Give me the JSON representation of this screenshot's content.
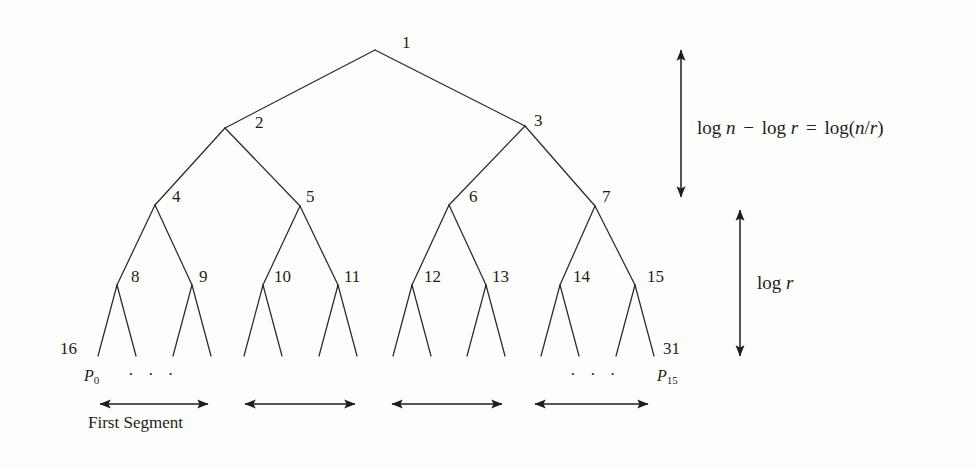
{
  "figure": {
    "type": "binary-tree-diagram",
    "background_color": "#fdfdfc",
    "ink_color": "#1d1d1d",
    "tree": {
      "levels": 5,
      "internal_nodes": [
        {
          "id": "1",
          "label": "1",
          "x": 375,
          "y": 50,
          "label_x": 402,
          "label_y": 34
        },
        {
          "id": "2",
          "label": "2",
          "x": 225,
          "y": 128,
          "label_x": 255,
          "label_y": 114
        },
        {
          "id": "3",
          "label": "3",
          "x": 525,
          "y": 126,
          "label_x": 534,
          "label_y": 112
        },
        {
          "id": "4",
          "label": "4",
          "x": 155,
          "y": 205,
          "label_x": 172,
          "label_y": 188
        },
        {
          "id": "5",
          "label": "5",
          "x": 300,
          "y": 206,
          "label_x": 306,
          "label_y": 188
        },
        {
          "id": "6",
          "label": "6",
          "x": 449,
          "y": 205,
          "label_x": 469,
          "label_y": 188
        },
        {
          "id": "7",
          "label": "7",
          "x": 595,
          "y": 206,
          "label_x": 602,
          "label_y": 188
        },
        {
          "id": "8",
          "label": "8",
          "x": 117,
          "y": 285,
          "label_x": 131,
          "label_y": 268
        },
        {
          "id": "9",
          "label": "9",
          "x": 192,
          "y": 285,
          "label_x": 199,
          "label_y": 268
        },
        {
          "id": "10",
          "label": "10",
          "x": 263,
          "y": 285,
          "label_x": 274,
          "label_y": 268
        },
        {
          "id": "11",
          "label": "11",
          "x": 338,
          "y": 285,
          "label_x": 344,
          "label_y": 268
        },
        {
          "id": "12",
          "label": "12",
          "x": 412,
          "y": 285,
          "label_x": 424,
          "label_y": 268
        },
        {
          "id": "13",
          "label": "13",
          "x": 486,
          "y": 285,
          "label_x": 492,
          "label_y": 268
        },
        {
          "id": "14",
          "label": "14",
          "x": 560,
          "y": 285,
          "label_x": 573,
          "label_y": 268
        },
        {
          "id": "15",
          "label": "15",
          "x": 635,
          "y": 285,
          "label_x": 647,
          "label_y": 268
        }
      ],
      "leaf_labels": [
        {
          "label": "16",
          "x": 60,
          "y": 340
        },
        {
          "label": "31",
          "x": 663,
          "y": 340
        }
      ]
    },
    "processors": [
      {
        "label": "P",
        "sub": "0",
        "x": 84,
        "y": 368
      },
      {
        "label": "P",
        "sub": "15",
        "x": 657,
        "y": 368
      }
    ],
    "ellipses": [
      {
        "text": "·  ·  ·",
        "x": 128,
        "y": 370
      },
      {
        "text": "·  ·  ·",
        "x": 570,
        "y": 370
      }
    ],
    "segment_arrows": [
      {
        "name": "first-segment",
        "x1": 100,
        "x2": 208,
        "y": 404
      },
      {
        "name": "second-segment",
        "x1": 245,
        "x2": 355,
        "y": 404
      },
      {
        "name": "third-segment",
        "x1": 392,
        "x2": 502,
        "y": 404
      },
      {
        "name": "fourth-segment",
        "x1": 535,
        "x2": 648,
        "y": 404
      }
    ],
    "segment_caption": {
      "text": "First Segment",
      "x": 88,
      "y": 414
    },
    "height_markers": [
      {
        "name": "upper-height-marker",
        "x": 681,
        "y1": 50,
        "y2": 197,
        "math": {
          "parts": [
            "log ",
            "n",
            " − ",
            "log ",
            "r",
            " = ",
            "log(",
            "n",
            "/",
            "r",
            ")"
          ],
          "plain": "log n − log r = log(n/r)"
        },
        "label_x": 697,
        "label_y": 120
      },
      {
        "name": "lower-height-marker",
        "x": 740,
        "y1": 210,
        "y2": 356,
        "math": {
          "parts": [
            "log ",
            "r"
          ],
          "plain": "log r"
        },
        "label_x": 757,
        "label_y": 275
      }
    ]
  }
}
